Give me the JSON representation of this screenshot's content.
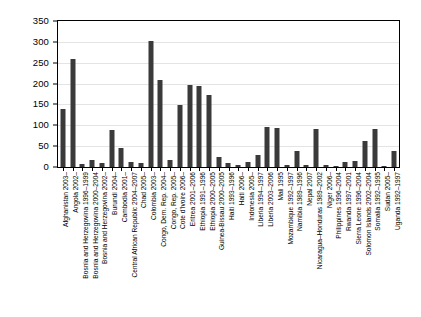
{
  "chart_data": {
    "type": "bar",
    "title": "",
    "xlabel": "",
    "ylabel": "",
    "ylim": [
      0,
      350
    ],
    "ytick_step": 50,
    "grid": true,
    "legend": null,
    "bar_color": "#3a3a3a",
    "yticks": [
      "0",
      "50",
      "100",
      "150",
      "200",
      "250",
      "300",
      "350"
    ],
    "categories": [
      "Afghanistan 2003–",
      "Angola 2002–",
      "Bosnia and Herzegovina 1996–1999",
      "Bosnia and Herzegovina 2000–2004",
      "Bosnia and Herzegovina 2002–",
      "Burundi 2004–",
      "Cambodia 2001–",
      "Central African Republic 2004–2007",
      "Chad 2005–",
      "Colombia 2003–",
      "Congo, Dem. Rep. 2004–",
      "Congo, Rep. 2005–",
      "Cote d'Ivoire 2006–",
      "Eritrea 2001–2006",
      "Ethiopia 1991–1996",
      "Ethiopia 2000–2005",
      "Guinea-Bissau 2000–2005",
      "Haiti 1993–1996",
      "Haiti 2006–",
      "Indonesia 2005–",
      "Liberia 1994–1997",
      "Liberia 2003–2006",
      "Mali 1995",
      "Mozambique 1992–1997",
      "Namibia 1989–1996",
      "Nepal 2007",
      "Nicaragua–Honduras 1989–2002",
      "Niger 2006–",
      "Philippines 1996–2004",
      "Rwanda 1997–2001",
      "Sierra Leone 1996–2004",
      "Solomon Islands 2002–2004",
      "Somalia 1992–1995",
      "Sudan 2005–",
      "Uganda 1992–1997"
    ],
    "values": [
      140,
      260,
      8,
      18,
      10,
      88,
      45,
      13,
      10,
      302,
      208,
      16,
      148,
      197,
      195,
      173,
      25,
      10,
      5,
      12,
      28,
      97,
      93,
      6,
      38,
      5,
      90,
      4,
      3,
      13,
      15,
      62,
      92,
      3,
      38
    ]
  }
}
